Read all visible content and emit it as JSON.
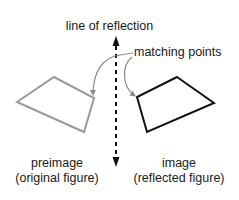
{
  "diagram": {
    "title_label": "line of reflection",
    "callout_label": "matching points",
    "preimage": {
      "label": "preimage",
      "sublabel": "(original figure)",
      "color": "#9a9a9a",
      "points": "54,77 94,98 84,132 17,102"
    },
    "image": {
      "label": "image",
      "sublabel": "(reflected figure)",
      "color": "#111111",
      "points": "177,77 214,103 147,132 137,97"
    },
    "axis": {
      "color": "#111111",
      "x": 116,
      "y_top": 37,
      "y_bottom": 166,
      "style": "dashed"
    },
    "arrow_color": "#8a8a8a"
  }
}
